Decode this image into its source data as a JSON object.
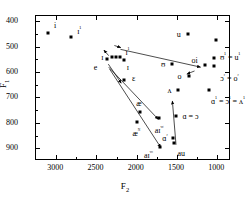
{
  "chart_data": {
    "type": "scatter",
    "title": "",
    "xlabel": "F2",
    "ylabel": "F1",
    "xlim": [
      3250,
      830
    ],
    "ylim": [
      380,
      950
    ],
    "x_reversed": true,
    "y_reversed": true,
    "grid": false,
    "legend": "none",
    "xticks": [
      3000,
      2500,
      2000,
      1500,
      1000
    ],
    "xticklabels": [
      "3000",
      "2500",
      "2000",
      "1500",
      "1000"
    ],
    "yticks": [
      400,
      500,
      600,
      700,
      800,
      900
    ],
    "yticklabels": [
      "400",
      "500",
      "600",
      "700",
      "800",
      "900"
    ],
    "points": [
      {
        "label": "i",
        "x": 3090,
        "y": 452,
        "lx": 6,
        "ly": -7
      },
      {
        "label": "ɪ¹",
        "x": 2800,
        "y": 468,
        "lx": 6,
        "ly": -7
      },
      {
        "label": "e",
        "x": 2360,
        "y": 553,
        "lx": -13,
        "ly": 9
      },
      {
        "label": "ɪ",
        "x": 2290,
        "y": 545,
        "lx": -11,
        "ly": 1
      },
      {
        "label": "ɪ",
        "x": 2245,
        "y": 545,
        "lx": 0,
        "ly": 0,
        "hide_label": true
      },
      {
        "label": "ɪ¹",
        "x": 2190,
        "y": 545,
        "lx": 5,
        "ly": -6
      },
      {
        "label": "ɪ",
        "x": 2150,
        "y": 556,
        "lx": 3,
        "ly": 8
      },
      {
        "label": "ɛ",
        "x": 2145,
        "y": 637,
        "lx": 8,
        "ly": -1
      },
      {
        "label": "ʊ",
        "x": 1550,
        "y": 572,
        "lx": -11,
        "ly": 1
      },
      {
        "label": "ʌ",
        "x": 1470,
        "y": 676,
        "lx": -11,
        "ly": 1
      },
      {
        "label": "o",
        "x": 1345,
        "y": 620,
        "lx": -11,
        "ly": 1
      },
      {
        "label": "u",
        "x": 1355,
        "y": 456,
        "lx": -11,
        "ly": 1
      },
      {
        "label": "<tour>",
        "x": 1000,
        "y": 480,
        "lx": 0,
        "ly": -10,
        "center": true
      },
      {
        "label": "oi",
        "x": 1145,
        "y": 578,
        "lx": -13,
        "ly": -4
      },
      {
        "label": "ʊ¹ = u¹",
        "x": 1030,
        "y": 548,
        "lx": 6,
        "ly": -2
      },
      {
        "label": "ɔʳ = oʳ",
        "x": 1025,
        "y": 580,
        "lx": 6,
        "ly": 11
      },
      {
        "label": "ɑ¹ = ɔ¹ = ʌ¹",
        "x": 1090,
        "y": 676,
        "lx": 2,
        "ly": 10
      },
      {
        "label": "æ",
        "x": 1945,
        "y": 762,
        "lx": -4,
        "ly": -8
      },
      {
        "label": "æᴺ",
        "x": 1990,
        "y": 800,
        "lx": -4,
        "ly": 10
      },
      {
        "label": "aɪᵛᵍ",
        "x": 1715,
        "y": 785,
        "lx": -4,
        "ly": 11
      },
      {
        "label": "aɪᵛᵒ",
        "x": 1700,
        "y": 898,
        "lx": -16,
        "ly": 7
      },
      {
        "label": "ɑʳ",
        "x": 1535,
        "y": 862,
        "lx": -11,
        "ly": -1
      },
      {
        "label": "au",
        "x": 1520,
        "y": 884,
        "lx": 3,
        "ly": 11
      },
      {
        "label": "ɑ = ɔ",
        "x": 1495,
        "y": 777,
        "lx": 6,
        "ly": 1
      }
    ],
    "arrows": [
      {
        "x1": 2335,
        "y1": 540,
        "x2": 2395,
        "y2": 518,
        "note": "e-arrow"
      },
      {
        "x1": 2265,
        "y1": 500,
        "x2": 2185,
        "y2": 508,
        "note": "i-cluster-arrow"
      },
      {
        "x1": 2190,
        "y1": 515,
        "x2": 1195,
        "y2": 585,
        "note": "long-right-arrow"
      },
      {
        "x1": 2340,
        "y1": 573,
        "x2": 2180,
        "y2": 648,
        "note": "eps-arrow"
      },
      {
        "x1": 2335,
        "y1": 585,
        "x2": 1720,
        "y2": 790,
        "note": "ai-vg-arrow"
      },
      {
        "x1": 2325,
        "y1": 592,
        "x2": 1690,
        "y2": 900,
        "note": "ai-vo-arrow"
      },
      {
        "x1": 1500,
        "y1": 890,
        "x2": 1545,
        "y2": 718,
        "note": "au-up-arrow"
      },
      {
        "x1": 1270,
        "y1": 600,
        "x2": 1365,
        "y2": 612,
        "note": "o-arrow"
      }
    ]
  }
}
